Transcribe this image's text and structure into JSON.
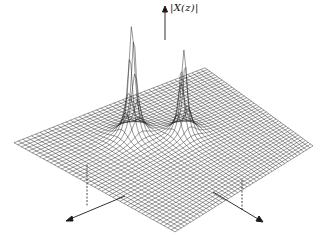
{
  "figure": {
    "axis_label": "|X(z)|",
    "line_color": "#1a1a1a",
    "background": "#ffffff"
  },
  "chart_data": {
    "type": "surface",
    "title": "",
    "zlabel": "|X(z)|",
    "xlabel": "",
    "ylabel": "",
    "grid": true,
    "features": [
      {
        "name": "pole-1",
        "kind": "peak",
        "relative_height": 1.0
      },
      {
        "name": "pole-2",
        "kind": "peak",
        "relative_height": 0.85
      }
    ],
    "axes": {
      "vertical_arrow": true,
      "horizontal_arrows": 2,
      "dashed_projection_lines": 2
    }
  }
}
